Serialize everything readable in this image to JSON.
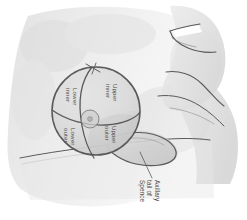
{
  "figure": {
    "background_color": "#ffffff"
  },
  "colors": {
    "body_fill": "#e2e2e2",
    "body_fill_light": "#ececec",
    "body_shadow": "#d6d6d6",
    "sphere_fill": "#d9d9d9",
    "sphere_fill_upper": "#dedede",
    "tail_fill": "#d2d2d2",
    "outline": "#5a5a5a",
    "outline_soft": "#8d8d8d",
    "label_text": "#4a4a4a",
    "highlight": "#ffffff"
  },
  "quadrants": [
    {
      "id": "upper-inner",
      "label_line_1": "Upper",
      "label_line_2": "inner",
      "position": "upper-right-of-sphere"
    },
    {
      "id": "lower-inner",
      "label_line_1": "Lower",
      "label_line_2": "inner",
      "position": "upper-left-of-sphere"
    },
    {
      "id": "lower-outer",
      "label_line_1": "Lower",
      "label_line_2": "outer",
      "position": "lower-left-of-sphere"
    },
    {
      "id": "upper-outer",
      "label_line_1": "Upper",
      "label_line_2": "outer",
      "position": "lower-right-of-sphere"
    }
  ],
  "callout": {
    "id": "axillary-tail",
    "label_line_1": "Axillary",
    "label_line_2": "tail of",
    "label_line_3": "Spence"
  },
  "anatomy_parts": [
    {
      "id": "head-jaw",
      "name": "head and jaw profile"
    },
    {
      "id": "neck",
      "name": "neck"
    },
    {
      "id": "shoulder",
      "name": "shoulder"
    },
    {
      "id": "arm",
      "name": "upper arm"
    },
    {
      "id": "chest-wall",
      "name": "chest wall"
    },
    {
      "id": "breast-sphere",
      "name": "breast modeled as sphere"
    },
    {
      "id": "areola",
      "name": "areola and nipple"
    },
    {
      "id": "vertical-meridian",
      "name": "vertical dividing meridian"
    },
    {
      "id": "horizontal-meridian",
      "name": "horizontal dividing meridian"
    },
    {
      "id": "axillary-tail-shape",
      "name": "axillary tail of Spence"
    }
  ]
}
